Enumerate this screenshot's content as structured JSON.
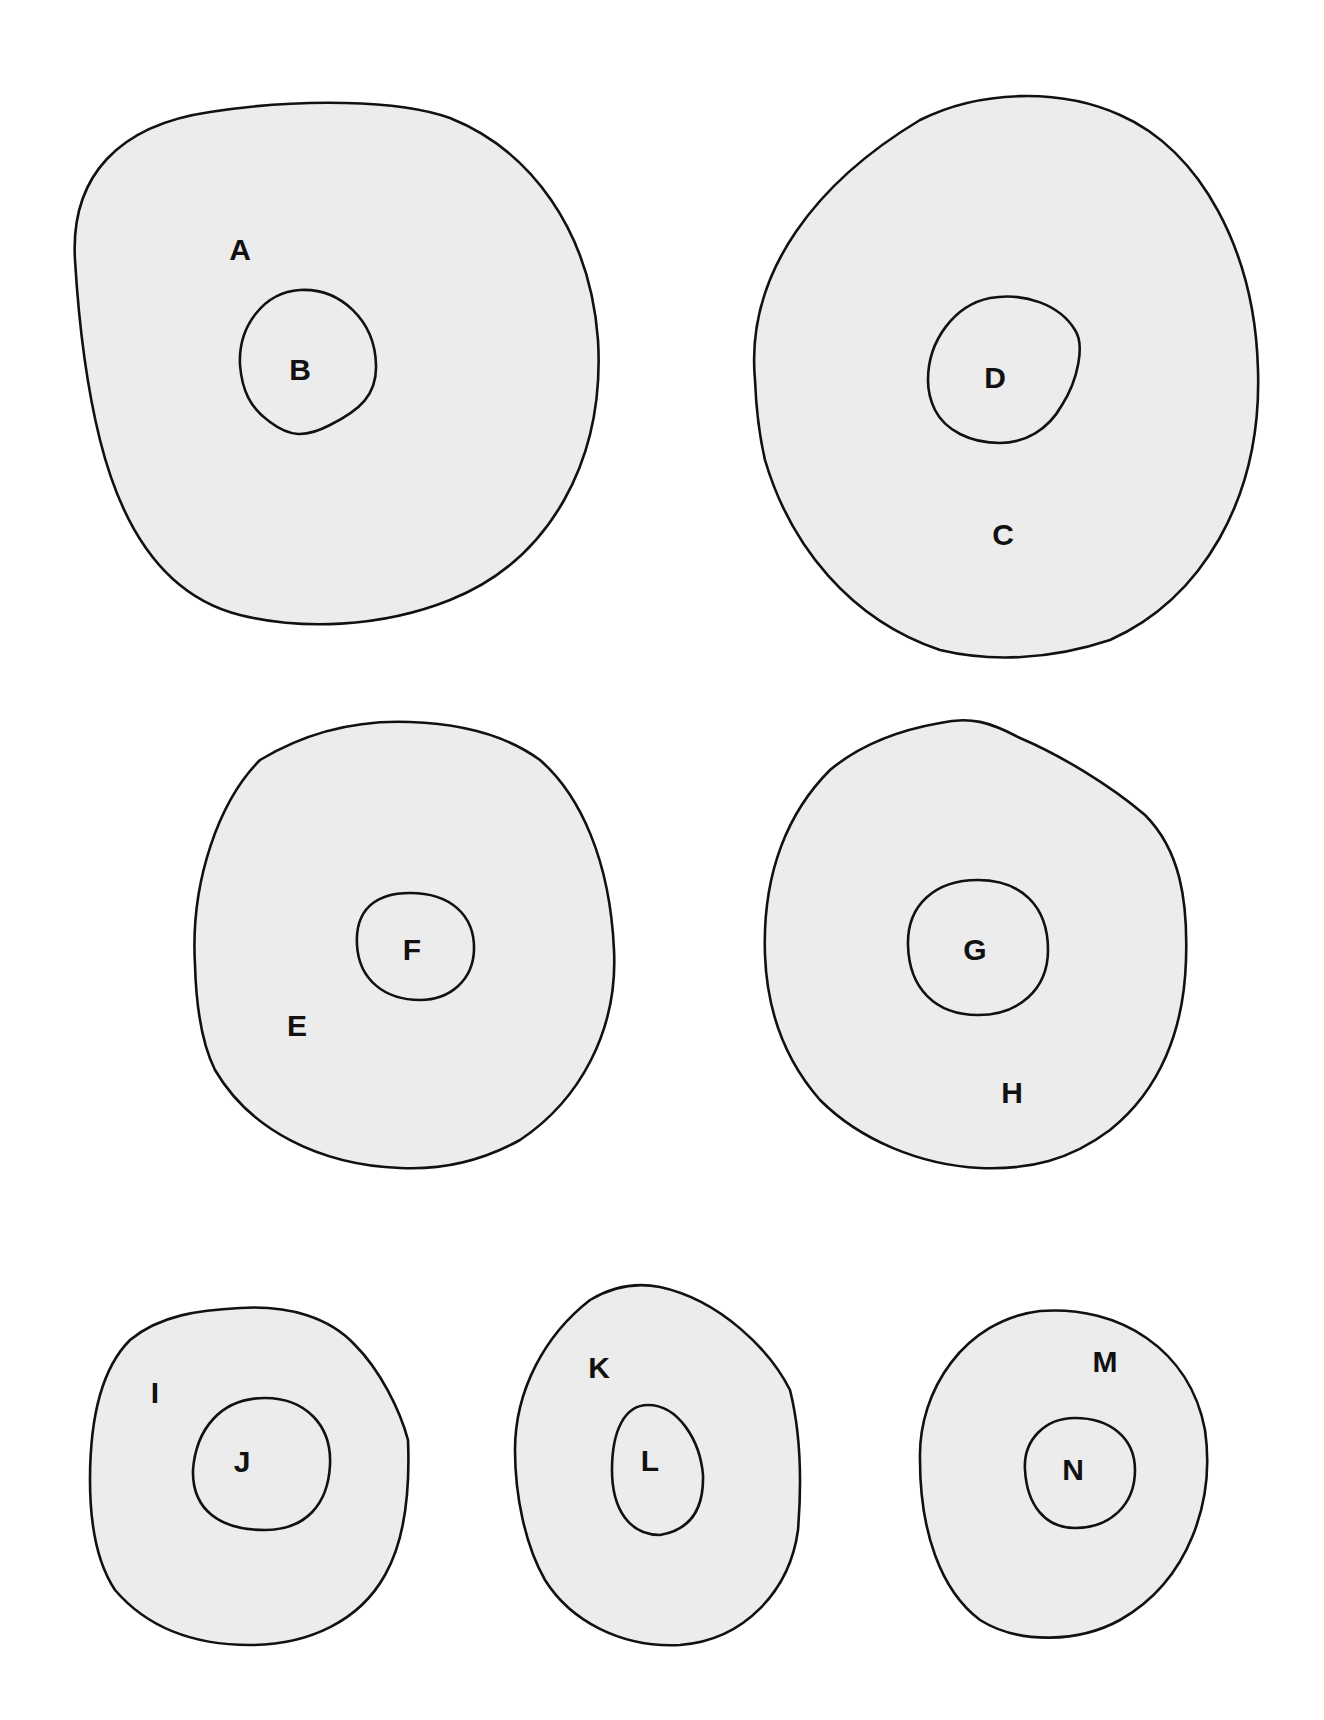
{
  "diagram": {
    "background": "#ffffff",
    "fill_color": "#ececec",
    "stroke_color": "#111111",
    "cells": [
      {
        "id": "cell-AB",
        "outer_label": "A",
        "inner_label": "B",
        "outer_path": "M 75 260 C 70 175 120 125 210 112 C 300 98 400 100 450 118 C 530 150 590 230 598 340 C 605 460 550 560 450 600 C 380 628 300 630 240 615 C 160 595 120 520 100 440 C 85 380 78 310 75 260 Z",
        "inner_path": "M 240 365 C 238 325 265 292 300 290 C 340 288 375 320 376 365 C 377 395 360 410 330 425 C 305 438 290 437 270 422 C 250 408 242 390 240 365 Z",
        "outer_label_pos": [
          240,
          252
        ],
        "inner_label_pos": [
          300,
          372
        ]
      },
      {
        "id": "cell-CD",
        "outer_label": "D",
        "outer_text": "C",
        "inner_label": "D",
        "outer_path": "M 755 380 C 745 270 820 180 920 120 C 980 90 1060 88 1120 115 C 1200 150 1255 250 1258 370 C 1262 500 1200 600 1110 640 C 1050 660 990 662 940 650 C 850 620 790 545 765 460 C 758 430 756 405 755 380 Z",
        "inner_path": "M 928 380 C 928 340 955 305 990 298 C 1025 292 1060 305 1075 330 C 1085 345 1078 380 1062 405 C 1048 430 1025 443 1000 443 C 970 443 945 430 935 410 C 930 400 928 390 928 380 Z",
        "outer_label_pos": [
          1003,
          537
        ],
        "inner_label_pos": [
          995,
          380
        ]
      },
      {
        "id": "cell-EF",
        "outer_label": "E",
        "inner_label": "F",
        "outer_path": "M 195 965 C 190 880 220 800 260 760 C 310 730 360 720 410 722 C 470 724 510 738 540 760 C 580 795 610 860 614 950 C 618 1030 580 1100 520 1140 C 480 1162 440 1170 400 1168 C 320 1165 250 1130 215 1070 C 200 1040 196 1000 195 965 Z",
        "inner_path": "M 357 945 C 355 910 375 893 410 893 C 450 893 475 915 474 950 C 473 980 450 1000 420 1000 C 385 1000 359 980 357 945 Z",
        "outer_label_pos": [
          297,
          1028
        ],
        "inner_label_pos": [
          412,
          952
        ]
      },
      {
        "id": "cell-GH",
        "outer_label": "H",
        "inner_label": "G",
        "outer_path": "M 765 955 C 762 870 790 810 830 770 C 860 745 900 730 940 723 C 970 716 990 722 1020 738 C 1060 755 1110 785 1145 815 C 1180 850 1188 900 1186 960 C 1184 1030 1160 1090 1110 1130 C 1070 1160 1030 1170 980 1168 C 920 1165 860 1140 820 1100 C 785 1060 767 1010 765 955 Z",
        "inner_path": "M 908 945 C 907 905 935 880 978 880 C 1020 880 1048 905 1048 950 C 1048 990 1018 1015 978 1015 C 935 1015 909 988 908 945 Z",
        "outer_label_pos": [
          1012,
          1095
        ],
        "inner_label_pos": [
          975,
          952
        ]
      },
      {
        "id": "cell-IJ",
        "outer_label": "I",
        "inner_label": "J",
        "outer_path": "M 90 1480 C 90 1420 100 1370 130 1340 C 160 1315 200 1310 240 1308 C 290 1305 330 1318 355 1345 C 380 1370 400 1410 408 1440 C 410 1490 405 1540 385 1575 C 360 1620 310 1645 250 1645 C 190 1645 145 1625 115 1590 C 95 1560 90 1520 90 1480 Z",
        "inner_path": "M 193 1470 C 196 1430 220 1398 265 1398 C 305 1398 332 1425 330 1465 C 328 1505 305 1530 265 1530 C 220 1530 192 1510 193 1470 Z",
        "outer_label_pos": [
          155,
          1395
        ],
        "inner_label_pos": [
          242,
          1464
        ]
      },
      {
        "id": "cell-KL",
        "outer_label": "K",
        "inner_label": "L",
        "outer_path": "M 515 1450 C 515 1390 545 1335 590 1300 C 615 1285 640 1283 660 1287 C 720 1300 770 1350 790 1390 C 800 1430 802 1480 798 1530 C 790 1590 745 1640 680 1645 C 620 1648 570 1620 545 1580 C 525 1545 515 1495 515 1450 Z",
        "inner_path": "M 612 1470 C 612 1430 625 1405 648 1405 C 678 1405 700 1440 703 1475 C 704 1510 690 1530 660 1535 C 630 1535 612 1510 612 1470 Z",
        "outer_label_pos": [
          599,
          1370
        ],
        "inner_label_pos": [
          650,
          1463
        ]
      },
      {
        "id": "cell-MN",
        "outer_label": "M",
        "inner_label": "N",
        "outer_path": "M 920 1460 C 918 1390 965 1320 1040 1311 C 1120 1305 1190 1350 1205 1430 C 1215 1500 1190 1580 1120 1620 C 1080 1642 1020 1645 980 1620 C 940 1590 920 1530 920 1460 Z",
        "inner_path": "M 1025 1470 C 1023 1440 1045 1418 1075 1418 C 1110 1418 1135 1438 1135 1470 C 1135 1505 1110 1528 1075 1528 C 1045 1528 1027 1505 1025 1470 Z",
        "outer_label_pos": [
          1105,
          1364
        ],
        "inner_label_pos": [
          1073,
          1472
        ]
      }
    ]
  }
}
